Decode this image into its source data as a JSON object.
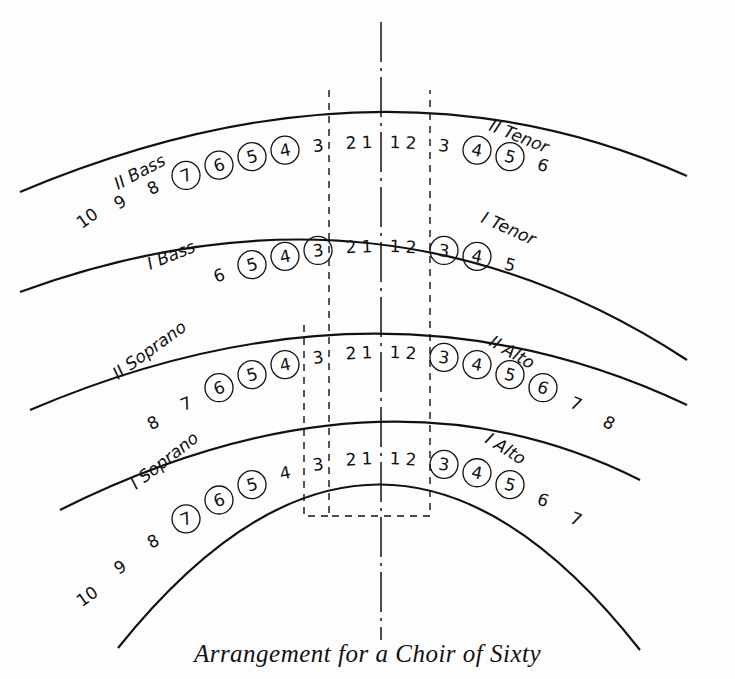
{
  "caption": "Arrangement for a Choir of Sixty",
  "rows": [
    {
      "name": "back-row",
      "arc_apex_y": 166,
      "left": {
        "label": "II Bass",
        "seats": [
          "10",
          "9",
          "8",
          "7",
          "6",
          "5",
          "4",
          "3",
          "2",
          "1"
        ],
        "circled": [
          "7",
          "6",
          "5",
          "4"
        ]
      },
      "right": {
        "label": "II Tenor",
        "seats": [
          "1",
          "2",
          "3",
          "4",
          "5",
          "6"
        ],
        "circled": [
          "4",
          "5"
        ]
      }
    },
    {
      "name": "third-row",
      "arc_apex_y": 270,
      "left": {
        "label": "I Bass",
        "seats": [
          "6",
          "5",
          "4",
          "3",
          "2",
          "1"
        ],
        "circled": [
          "5",
          "4",
          "3"
        ]
      },
      "right": {
        "label": "I Tenor",
        "seats": [
          "1",
          "2",
          "3",
          "4",
          "5"
        ],
        "circled": [
          "3",
          "4"
        ]
      }
    },
    {
      "name": "second-row",
      "arc_apex_y": 375,
      "left": {
        "label": "II Soprano",
        "seats": [
          "8",
          "7",
          "6",
          "5",
          "4",
          "3",
          "2",
          "1"
        ],
        "circled": [
          "6",
          "5",
          "4"
        ]
      },
      "right": {
        "label": "II Alto",
        "seats": [
          "1",
          "2",
          "3",
          "4",
          "5",
          "6",
          "7",
          "8"
        ],
        "circled": [
          "3",
          "4",
          "5",
          "6"
        ]
      }
    },
    {
      "name": "front-row",
      "arc_apex_y": 481,
      "left": {
        "label": "I Soprano",
        "seats": [
          "10",
          "9",
          "8",
          "7",
          "6",
          "5",
          "4",
          "3",
          "2",
          "1"
        ],
        "circled": [
          "7",
          "6",
          "5"
        ]
      },
      "right": {
        "label": "I Alto",
        "seats": [
          "1",
          "2",
          "3",
          "4",
          "5",
          "6",
          "7"
        ],
        "circled": [
          "3",
          "4",
          "5"
        ]
      }
    }
  ],
  "guides": {
    "center_line": "dash-dot",
    "inner_box": "dashed",
    "soprano_extension": "dashed"
  }
}
